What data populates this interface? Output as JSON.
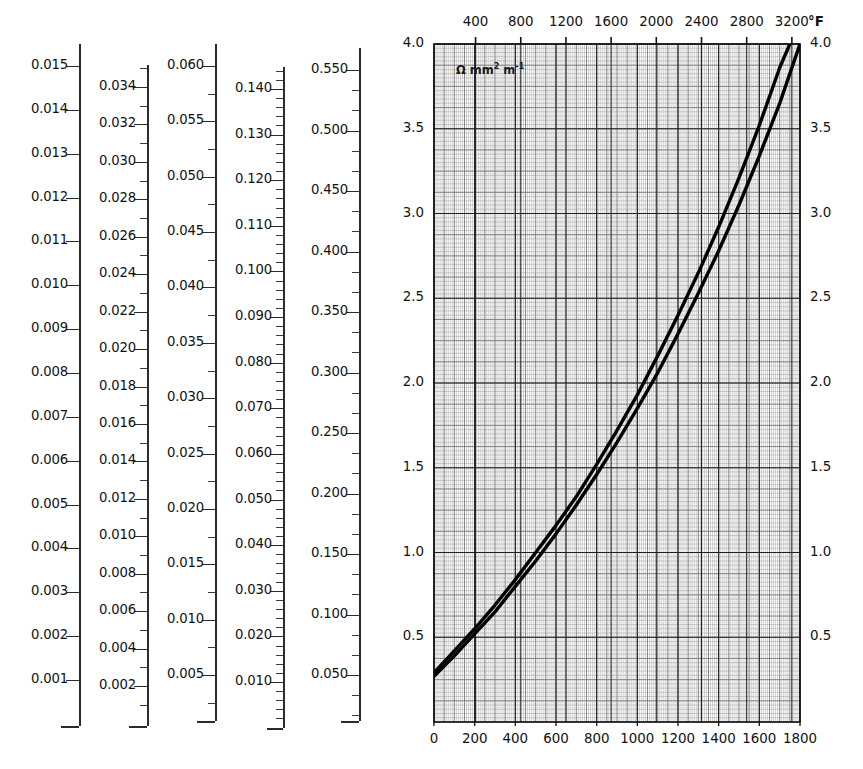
{
  "figure": {
    "kind": "resistivity-temperature-nomogram",
    "scales": [
      {
        "id": "scale-1",
        "name": "scale-column-1",
        "labels": [
          "0.015",
          "0.014",
          "0.013",
          "0.012",
          "0.011",
          "0.010",
          "0.009",
          "0.008",
          "0.007",
          "0.006",
          "0.005",
          "0.004",
          "0.003",
          "0.002",
          "0.001"
        ],
        "minor_per_major": 0,
        "min": 0.001,
        "max": 0.015,
        "step": 0.001
      },
      {
        "id": "scale-2",
        "name": "scale-column-2",
        "labels": [
          "0.034",
          "0.032",
          "0.030",
          "0.028",
          "0.026",
          "0.024",
          "0.022",
          "0.020",
          "0.018",
          "0.016",
          "0.014",
          "0.012",
          "0.010",
          "0.008",
          "0.006",
          "0.004",
          "0.002"
        ],
        "minor_per_major": 2,
        "min": 0.002,
        "max": 0.034,
        "step": 0.002
      },
      {
        "id": "scale-3",
        "name": "scale-column-3",
        "labels": [
          "0.060",
          "0.055",
          "0.050",
          "0.045",
          "0.040",
          "0.035",
          "0.030",
          "0.025",
          "0.020",
          "0.015",
          "0.010",
          "0.005"
        ],
        "minor_per_major": 2,
        "min": 0.005,
        "max": 0.06,
        "step": 0.005
      },
      {
        "id": "scale-4",
        "name": "scale-column-4",
        "labels": [
          "0.140",
          "0.130",
          "0.120",
          "0.110",
          "0.100",
          "0.090",
          "0.080",
          "0.070",
          "0.060",
          "0.050",
          "0.040",
          "0.030",
          "0.020",
          "0.010"
        ],
        "minor_per_major": 5,
        "min": 0.01,
        "max": 0.14,
        "step": 0.01
      },
      {
        "id": "scale-5",
        "name": "scale-column-5",
        "labels": [
          "0.550",
          "0.500",
          "0.450",
          "0.400",
          "0.350",
          "0.300",
          "0.250",
          "0.200",
          "0.150",
          "0.100",
          "0.050"
        ],
        "minor_per_major": 3,
        "min": 0.05,
        "max": 0.55,
        "step": 0.05
      }
    ]
  },
  "chart_data": {
    "type": "line",
    "title": "",
    "unit_annotation": "Ω mm² m⁻¹",
    "unit_annotation_base": "Ω  mm",
    "unit_sup_1": "2",
    "unit_annotation_mid": " m",
    "unit_sup_2": "-1",
    "xlabel": "",
    "xlabel_top": "°F",
    "ylabel": "",
    "xlim": [
      0,
      1800
    ],
    "ylim": [
      0,
      4.0
    ],
    "xticks": [
      0,
      200,
      400,
      600,
      800,
      1000,
      1200,
      1400,
      1600,
      1800
    ],
    "xticklabels": [
      "0",
      "200",
      "400",
      "600",
      "800",
      "1000",
      "1200",
      "1400",
      "1600",
      "1800"
    ],
    "xticks_top_f": [
      400,
      800,
      1200,
      1600,
      2000,
      2400,
      2800,
      3200
    ],
    "xticklabels_top": [
      "400",
      "800",
      "1200",
      "1600",
      "2000",
      "2400",
      "2800",
      "3200"
    ],
    "yticks": [
      0.5,
      1.0,
      1.5,
      2.0,
      2.5,
      3.0,
      3.5,
      4.0
    ],
    "yticklabels": [
      "0.5",
      "1.0",
      "1.5",
      "2.0",
      "2.5",
      "3.0",
      "3.5",
      "4.0"
    ],
    "yticklabels_right": [
      "0.5",
      "1.0",
      "1.5",
      "2.0",
      "2.5",
      "3.0",
      "3.5",
      "4.0"
    ],
    "grid": true,
    "legend": "none",
    "series": [
      {
        "name": "upper-curve",
        "x": [
          0,
          100,
          200,
          300,
          400,
          500,
          600,
          700,
          800,
          900,
          1000,
          1100,
          1200,
          1300,
          1400,
          1500,
          1600,
          1700,
          1750
        ],
        "y": [
          0.29,
          0.42,
          0.55,
          0.69,
          0.84,
          1.0,
          1.16,
          1.33,
          1.52,
          1.72,
          1.93,
          2.16,
          2.4,
          2.65,
          2.92,
          3.21,
          3.52,
          3.86,
          4.0
        ]
      },
      {
        "name": "lower-curve",
        "x": [
          0,
          100,
          200,
          300,
          400,
          500,
          600,
          700,
          800,
          900,
          1000,
          1100,
          1200,
          1300,
          1400,
          1500,
          1600,
          1700,
          1800
        ],
        "y": [
          0.27,
          0.39,
          0.52,
          0.65,
          0.8,
          0.95,
          1.11,
          1.28,
          1.46,
          1.65,
          1.85,
          2.06,
          2.29,
          2.53,
          2.78,
          3.05,
          3.34,
          3.65,
          4.0
        ]
      }
    ]
  }
}
